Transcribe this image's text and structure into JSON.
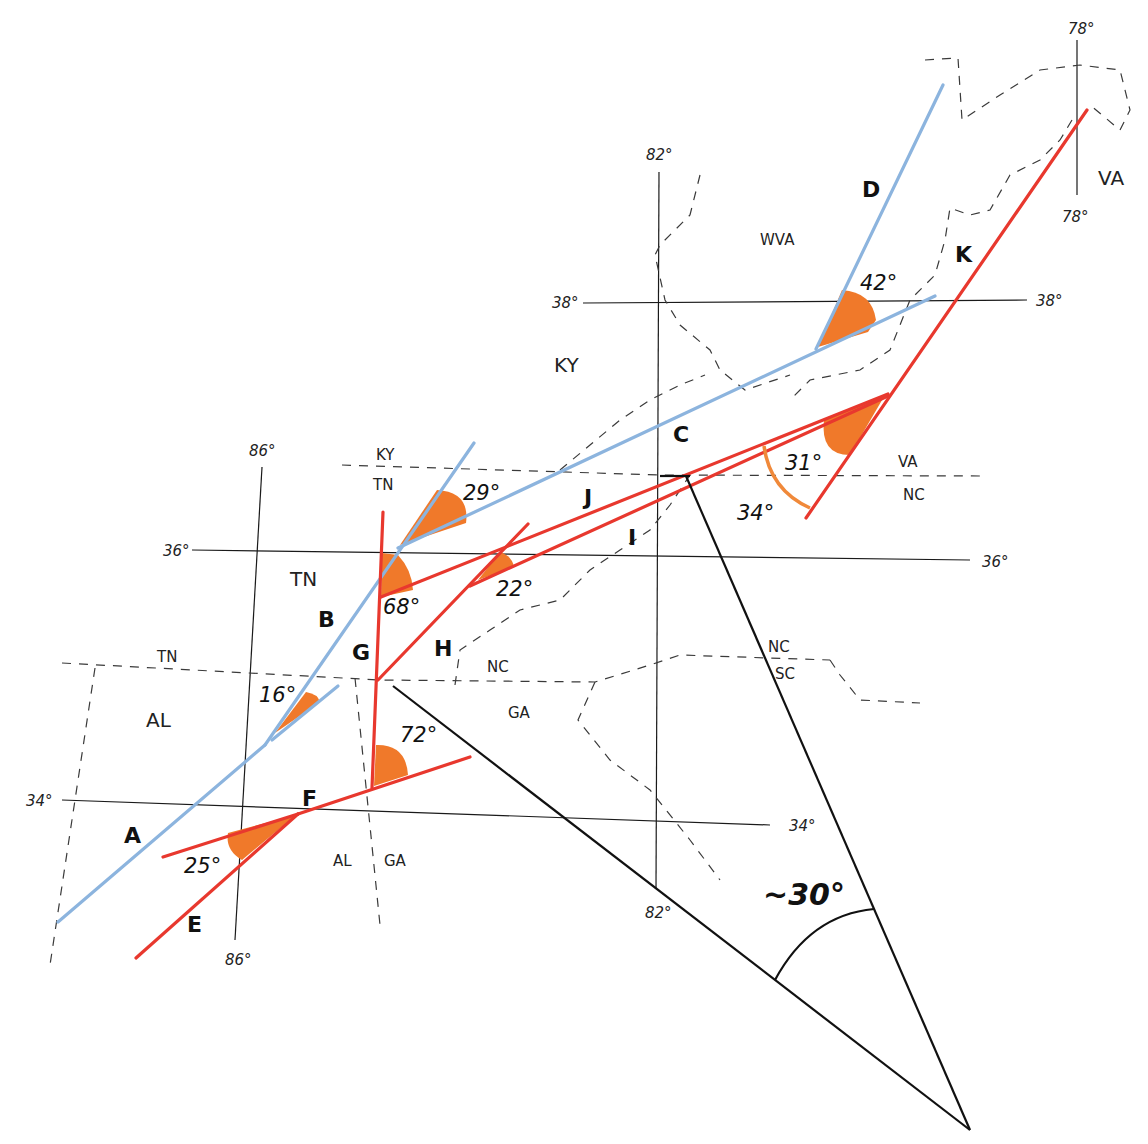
{
  "colors": {
    "blue_line": "#8cb4de",
    "red_line": "#e8382e",
    "wedge_fill": "#f0792a",
    "grid": "#1a1a1a",
    "border_dash": "#3a3a3a"
  },
  "coordinates": {
    "lon_78_top": "78°",
    "lon_78_bottom": "78°",
    "lon_82_top": "82°",
    "lon_82_bottom": "82°",
    "lon_86_top": "86°",
    "lon_86_bottom": "86°",
    "lat_38_left": "38°",
    "lat_38_right": "38°",
    "lat_36_left": "36°",
    "lat_36_right": "36°",
    "lat_34_left": "34°",
    "lat_34_right": "34°"
  },
  "states": {
    "va_top": "VA",
    "wva": "WVA",
    "ky_main": "KY",
    "ky_border": "KY",
    "tn_border": "TN",
    "tn_main": "TN",
    "tn_al_border": "TN",
    "al_main": "AL",
    "al_bottom": "AL",
    "ga_bottom": "GA",
    "ga_main": "GA",
    "nc_main": "NC",
    "va_border": "VA",
    "nc_border": "NC",
    "nc_sc_border": "NC",
    "sc": "SC"
  },
  "segments": {
    "A": "A",
    "B": "B",
    "C": "C",
    "D": "D",
    "E": "E",
    "F": "F",
    "G": "G",
    "H": "H",
    "I": "I",
    "J": "J",
    "K": "K"
  },
  "angles": {
    "a42": "42°",
    "a29": "29°",
    "a31": "31°",
    "a34": "34°",
    "a68": "68°",
    "a22": "22°",
    "a16": "16°",
    "a72": "72°",
    "a25": "25°",
    "overall": "~30°"
  }
}
